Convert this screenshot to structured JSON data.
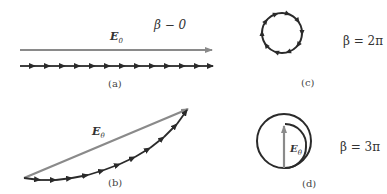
{
  "panels": {
    "a": {
      "caption": "(a)",
      "beta_label": "β − 0",
      "vector_label": "E",
      "vector_subscript": "0",
      "arrow_count": 13
    },
    "b": {
      "caption": "(b)",
      "vector_label": "E",
      "vector_subscript": "θ",
      "arrow_count": 11
    },
    "c": {
      "caption": "(c)",
      "beta_label": "β = 2π",
      "arrow_count": 11
    },
    "d": {
      "caption": "(d)",
      "beta_label": "β = 3π",
      "vector_label": "E",
      "vector_subscript": "θ"
    }
  },
  "colors": {
    "resultant": "#8a8a8a",
    "phasor_chain": "#2a2a2a",
    "text": "#333333"
  }
}
